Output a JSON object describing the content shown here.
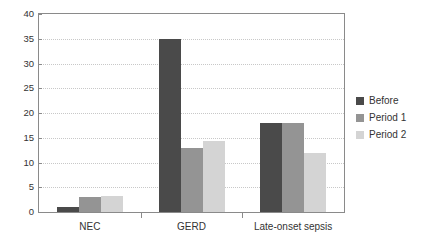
{
  "chart_data": {
    "type": "bar",
    "title": "",
    "subtitle": "",
    "xlabel": "",
    "ylabel": "",
    "categories": [
      "NEC",
      "GERD",
      "Late-onset sepsis"
    ],
    "series": [
      {
        "name": "Before",
        "values": [
          1,
          35,
          18
        ],
        "color": "#4a4a4a"
      },
      {
        "name": "Period 1",
        "values": [
          3,
          13,
          18
        ],
        "color": "#949494"
      },
      {
        "name": "Period 2",
        "values": [
          3.2,
          14.4,
          12
        ],
        "color": "#d4d4d4"
      }
    ],
    "ylim": [
      0,
      40
    ],
    "yticks": [
      0,
      5,
      10,
      15,
      20,
      25,
      30,
      35,
      40
    ],
    "ytick_labels": [
      "0",
      "5",
      "10",
      "15",
      "20",
      "25",
      "30",
      "35",
      "40"
    ],
    "grid": true,
    "grid_axis": "y",
    "legend_position": "right",
    "plot_background": "#ffffff",
    "axis_color": "#8a8a8a",
    "grid_color": "#c8c8c8",
    "text_color": "#333333"
  },
  "legend": {
    "entries": [
      {
        "label": "Before",
        "color": "#4a4a4a"
      },
      {
        "label": "Period 1",
        "color": "#949494"
      },
      {
        "label": "Period 2",
        "color": "#d4d4d4"
      }
    ]
  }
}
